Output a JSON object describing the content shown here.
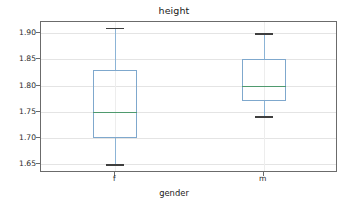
{
  "chart_data": {
    "type": "box",
    "title": "height",
    "xlabel": "gender",
    "ylabel": "",
    "categories": [
      "f",
      "m"
    ],
    "ylim": [
      1.6335,
      1.9215
    ],
    "yticks": [
      1.65,
      1.7,
      1.75,
      1.8,
      1.85,
      1.9
    ],
    "ytick_labels": [
      "1.65",
      "1.70",
      "1.75",
      "1.80",
      "1.85",
      "1.90"
    ],
    "grid": true,
    "legend": null,
    "boxes": [
      {
        "category": "f",
        "whisker_low": 1.65,
        "q1": 1.7,
        "median": 1.75,
        "q3": 1.83,
        "whisker_high": 1.91,
        "outliers": []
      },
      {
        "category": "m",
        "whisker_low": 1.742,
        "q1": 1.77,
        "median": 1.8,
        "q3": 1.85,
        "whisker_high": 1.9,
        "outliers": []
      }
    ],
    "colors": {
      "box_edge": "#7fa8cd",
      "whisker": "#8cb4d6",
      "cap": "#3f3f3f",
      "median": "#4f9a6e",
      "grid": "#e4e4e4",
      "axes_frame": "#6b6b6b",
      "text": "#1a1a1a",
      "background": "#ffffff"
    }
  }
}
